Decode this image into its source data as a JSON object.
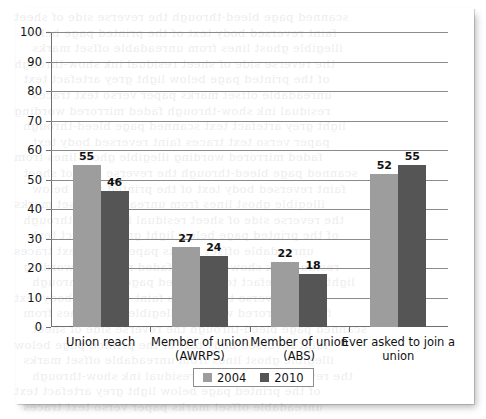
{
  "chart_data": {
    "type": "bar",
    "title": "",
    "subtitle": "",
    "xlabel": "",
    "ylabel": "",
    "ylim": [
      0,
      100
    ],
    "ytick_step": 10,
    "yticks": [
      "100",
      "90",
      "80",
      "70",
      "60",
      "50",
      "40",
      "30",
      "20",
      "10",
      "0"
    ],
    "grid": true,
    "legend_position": "bottom-center",
    "categories": [
      "Union reach",
      "Member of union\n(AWRPS)",
      "Member of union\n(ABS)",
      "Ever asked to join a\nunion"
    ],
    "series": [
      {
        "name": "2004",
        "color": "#9d9d9d",
        "values": [
          55,
          27,
          22,
          52
        ]
      },
      {
        "name": "2010",
        "color": "#555555",
        "values": [
          46,
          24,
          18,
          55
        ]
      }
    ],
    "data_labels": [
      [
        "55",
        "27",
        "22",
        "52"
      ],
      [
        "46",
        "24",
        "18",
        "55"
      ]
    ]
  },
  "legend": {
    "entries": [
      {
        "label": "2004",
        "color": "#9d9d9d"
      },
      {
        "label": "2010",
        "color": "#555555"
      }
    ]
  },
  "bleed_text": [
    "scanned page bleed-through",
    "faint reversed body text",
    "illegible ghost lines from",
    "the reverse side of sheet",
    "of the printed page below",
    "unreadable offset marks",
    "residual ink show-through",
    "light grey artefact text",
    "paper verso text traces",
    "faded mirrored wording"
  ]
}
